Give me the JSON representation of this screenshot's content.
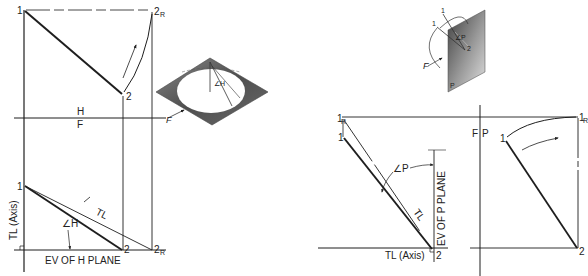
{
  "colors": {
    "ink": "#1e1e1e",
    "thin_ink": "#333333",
    "plane_dark": "#5a5a5a",
    "plane_light": "#d8d8d8",
    "background": "#ffffff"
  },
  "left_figure": {
    "top_view": {
      "point_1": "1",
      "point_2": "2",
      "point_2r": "2",
      "point_2r_sub": "R"
    },
    "fold_line": {
      "upper": "H",
      "lower": "F"
    },
    "pictorial": {
      "direction_label": "F",
      "angle_label": "∠H"
    },
    "front_view": {
      "point_1": "1",
      "point_2": "2",
      "point_2r": "2",
      "point_2r_sub": "R",
      "tl_label": "TL",
      "angle_label": "∠H",
      "axis_label": "TL (Axis)",
      "ev_label": "EV OF H PLANE"
    }
  },
  "right_figure": {
    "pictorial": {
      "point_1": "1",
      "point_1r": "1",
      "point_1r_sub": "R",
      "point_2": "2",
      "direction_label": "F",
      "plane_label": "P",
      "angle_label": "∠P"
    },
    "fold_line": {
      "left": "F",
      "right": "P"
    },
    "front_view": {
      "point_1": "1",
      "point_1r": "1",
      "point_1r_sub": "R",
      "point_2": "2",
      "tl_label": "TL",
      "angle_label": "∠P",
      "axis_label": "TL (Axis)",
      "ev_label": "EV OF P PLANE"
    },
    "side_view": {
      "point_1": "1",
      "point_1r": "1",
      "point_1r_sub": "R",
      "point_2": "2"
    }
  }
}
